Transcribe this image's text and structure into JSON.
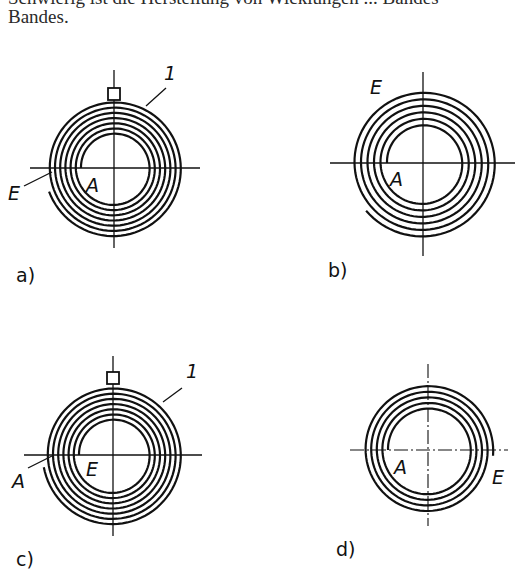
{
  "text": {
    "line_1": "Schwierig ist die Herstellung von Wicklungen ... Bandes",
    "line_2": "Bandes."
  },
  "figures": [
    {
      "id": "a",
      "caption": "a)",
      "labels": {
        "start": "A",
        "end": "E",
        "part": "1"
      },
      "has_mounting_tab": true,
      "turns": 7,
      "description": "spiral spring, start A at inner turn, end E at outer left"
    },
    {
      "id": "b",
      "caption": "b)",
      "labels": {
        "start": "A",
        "end": "E"
      },
      "has_mounting_tab": false,
      "turns": 6,
      "description": "spiral spring with free outer end E at upper left"
    },
    {
      "id": "c",
      "caption": "c)",
      "labels": {
        "start": "A",
        "end": "E",
        "part": "1"
      },
      "has_mounting_tab": true,
      "turns": 7,
      "description": "spiral spring, start A at outer left, end E at inner turn"
    },
    {
      "id": "d",
      "caption": "d)",
      "labels": {
        "start": "A",
        "end": "E"
      },
      "has_mounting_tab": false,
      "turns": 5,
      "description": "spiral spring, start A inner left, end E at outer right"
    }
  ]
}
